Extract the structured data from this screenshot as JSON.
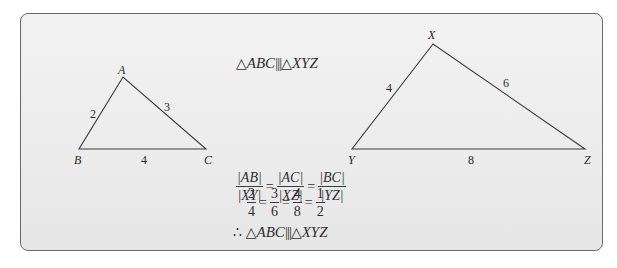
{
  "figure": {
    "statement": {
      "left_triangle": "ABC",
      "right_triangle": "XYZ",
      "symbol": "|||"
    },
    "triangle_small": {
      "vertices": {
        "A": [
          123,
          77
        ],
        "B": [
          79,
          149
        ],
        "C": [
          206,
          149
        ]
      },
      "labels": {
        "A": "A",
        "B": "B",
        "C": "C"
      },
      "sides": {
        "AB": "2",
        "AC": "3",
        "BC": "4"
      }
    },
    "triangle_large": {
      "vertices": {
        "X": [
          433,
          44
        ],
        "Y": [
          352,
          149
        ],
        "Z": [
          585,
          149
        ]
      },
      "labels": {
        "X": "X",
        "Y": "Y",
        "Z": "Z"
      },
      "sides": {
        "XY": "4",
        "XZ": "6",
        "YZ": "8"
      }
    },
    "ratios": {
      "row1": [
        {
          "num": "|AB|",
          "den": "|XY|"
        },
        {
          "num": "|AC|",
          "den": "|XZ|"
        },
        {
          "num": "|BC|",
          "den": "|YZ|"
        }
      ],
      "equals": "=",
      "row2": [
        {
          "num": "2",
          "den": "4"
        },
        {
          "num": "3",
          "den": "6"
        },
        {
          "num": "4",
          "den": "8"
        },
        {
          "num": "1",
          "den": "2"
        }
      ]
    },
    "conclusion": {
      "therefore": "∴",
      "left_triangle": "ABC",
      "right_triangle": "XYZ",
      "symbol": "|||"
    },
    "triangle_symbol": "△",
    "colors": {
      "line": "#3a3a3a",
      "text": "#2f2f2f",
      "border": "#6a6a6a",
      "background": "#eeeeee"
    }
  }
}
